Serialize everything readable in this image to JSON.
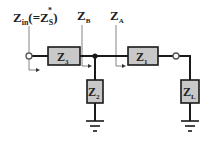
{
  "diagram": {
    "type": "impedance matching network schematic",
    "labels": {
      "zin": {
        "main": "Z",
        "sub": "in",
        "paren_open": "(=",
        "zs_main": "Z",
        "zs_sub": "S",
        "zs_sup": "*",
        "paren_close": ")"
      },
      "zb": {
        "main": "Z",
        "sub": "B"
      },
      "za": {
        "main": "Z",
        "sub": "A"
      }
    },
    "components": [
      {
        "id": "z3",
        "main": "Z",
        "sub": "3",
        "orientation": "series"
      },
      {
        "id": "z2",
        "main": "Z",
        "sub": "2",
        "orientation": "shunt"
      },
      {
        "id": "z1",
        "main": "Z",
        "sub": "1",
        "orientation": "series"
      },
      {
        "id": "zl",
        "main": "Z",
        "sub": "L",
        "orientation": "shunt-load"
      }
    ],
    "colors": {
      "box_fill": "#c8c8c8",
      "wire": "#1a1a1a",
      "leader": "#666666"
    }
  }
}
